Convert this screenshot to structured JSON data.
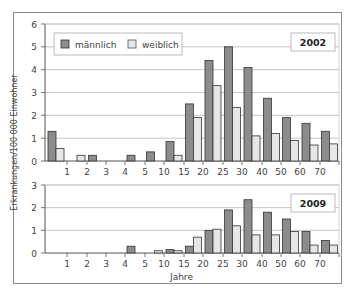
{
  "chart_data": [
    {
      "type": "bar",
      "title": "2002",
      "xlabel": "Jahre",
      "ylabel": "Erkrankungen/100 000 Einwohner",
      "ylim": [
        0,
        6
      ],
      "yticks": [
        0,
        1,
        2,
        3,
        4,
        5,
        6
      ],
      "grid": true,
      "legend_position": "top-left",
      "x_tick_labels": [
        "1",
        "2",
        "3",
        "4",
        "5",
        "10",
        "15",
        "20",
        "25",
        "30",
        "40",
        "50",
        "60",
        "70"
      ],
      "categories": [
        "<1",
        "1-2",
        "2-3",
        "3-4",
        "4-5",
        "5-10",
        "10-15",
        "15-20",
        "20-25",
        "25-30",
        "30-40",
        "40-50",
        "50-60",
        "60-70",
        ">70"
      ],
      "series": [
        {
          "name": "männlich",
          "color": "#8c8c8c",
          "values": [
            1.3,
            0,
            0.25,
            0,
            0.25,
            0.4,
            0.85,
            2.5,
            4.4,
            5.0,
            4.1,
            2.75,
            1.9,
            1.65,
            1.3
          ]
        },
        {
          "name": "weiblich",
          "color": "#e6e6e6",
          "values": [
            0.55,
            0.25,
            0,
            0,
            0,
            0,
            0.25,
            1.9,
            3.3,
            2.35,
            1.1,
            1.2,
            0.9,
            0.7,
            0.75
          ]
        }
      ]
    },
    {
      "type": "bar",
      "title": "2009",
      "xlabel": "Jahre",
      "ylabel": "Erkrankungen/100 000 Einwohner",
      "ylim": [
        0,
        3
      ],
      "yticks": [
        0,
        1,
        2,
        3
      ],
      "grid": true,
      "x_tick_labels": [
        "1",
        "2",
        "3",
        "4",
        "5",
        "10",
        "15",
        "20",
        "25",
        "30",
        "40",
        "50",
        "60",
        "70"
      ],
      "categories": [
        "<1",
        "1-2",
        "2-3",
        "3-4",
        "4-5",
        "5-10",
        "10-15",
        "15-20",
        "20-25",
        "25-30",
        "30-40",
        "40-50",
        "50-60",
        "60-70",
        ">70"
      ],
      "series": [
        {
          "name": "männlich",
          "color": "#8c8c8c",
          "values": [
            0,
            0,
            0,
            0,
            0.3,
            0,
            0.15,
            0.3,
            1.0,
            1.9,
            2.35,
            1.8,
            1.5,
            0.95,
            0.55
          ]
        },
        {
          "name": "weiblich",
          "color": "#e6e6e6",
          "values": [
            0,
            0,
            0,
            0,
            0,
            0.1,
            0.1,
            0.7,
            1.05,
            1.2,
            0.8,
            0.8,
            0.95,
            0.35,
            0.35
          ]
        }
      ]
    }
  ],
  "legend": {
    "male": "männlich",
    "female": "weiblich"
  },
  "labels": {
    "ylabel": "Erkrankungen/100 000 Einwohner",
    "xlabel": "Jahre",
    "panel1": "2002",
    "panel2": "2009"
  }
}
